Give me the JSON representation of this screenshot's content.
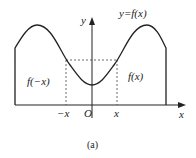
{
  "diagram": {
    "curve_label": "y=f(x)",
    "y_axis_label": "y",
    "x_axis_label": "x",
    "origin_label": "O",
    "neg_x_tick": "−x",
    "pos_x_tick": "x",
    "left_region_label": "f(−x)",
    "right_region_label": "f(x)",
    "caption": "(a)",
    "stroke_color": "#222222"
  }
}
